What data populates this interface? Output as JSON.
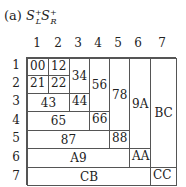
{
  "caption": {
    "prefix": "(a)",
    "s1": "S",
    "s1_sup": "+",
    "s1_sub": "L",
    "s2": "S",
    "s2_sup": "+",
    "s2_sub": "R"
  },
  "columns": [
    "1",
    "2",
    "3",
    "4",
    "5",
    "6",
    "7"
  ],
  "rows": [
    "1",
    "2",
    "3",
    "4",
    "5",
    "6",
    "7"
  ],
  "cells": [
    {
      "label": "00"
    },
    {
      "label": "12"
    },
    {
      "label": "34"
    },
    {
      "label": "56"
    },
    {
      "label": "78"
    },
    {
      "label": "9A"
    },
    {
      "label": "BC"
    },
    {
      "label": "21"
    },
    {
      "label": "22"
    },
    {
      "label": "43"
    },
    {
      "label": "44"
    },
    {
      "label": "65"
    },
    {
      "label": "66"
    },
    {
      "label": "87"
    },
    {
      "label": "88"
    },
    {
      "label": "A9"
    },
    {
      "label": "AA"
    },
    {
      "label": "CB"
    },
    {
      "label": "CC"
    }
  ]
}
